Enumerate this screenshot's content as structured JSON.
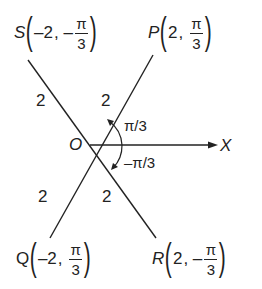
{
  "diagram": {
    "origin_label": "O",
    "axis_label": "X",
    "points": [
      {
        "name": "S",
        "r": "–2",
        "sign": "–",
        "num": "π",
        "den": "3"
      },
      {
        "name": "P",
        "r": "2",
        "sign": "",
        "num": "π",
        "den": "3"
      },
      {
        "name": "Q",
        "r": "–2",
        "sign": "",
        "num": "π",
        "den": "3"
      },
      {
        "name": "R",
        "r": "2",
        "sign": "–",
        "num": "π",
        "den": "3"
      }
    ],
    "segment_labels": {
      "os": "2",
      "op": "2",
      "oq": "2",
      "or": "2"
    },
    "angles": {
      "upper": "π/3",
      "lower": "–π/3"
    },
    "colors": {
      "line": "#222222",
      "background": "#ffffff"
    }
  }
}
